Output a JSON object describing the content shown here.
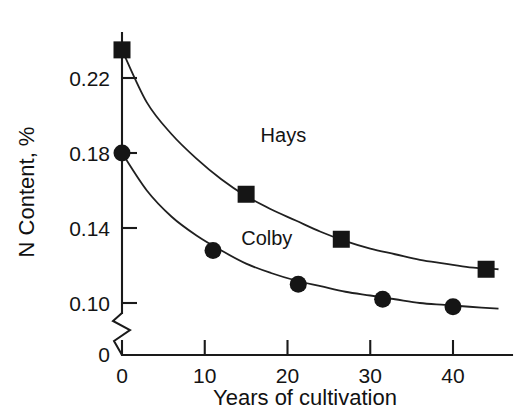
{
  "chart_data": {
    "type": "scatter",
    "title": "",
    "xlabel": "Years of cultivation",
    "ylabel": "N Content, %",
    "xlim": [
      0,
      46
    ],
    "ylim": [
      0.085,
      0.243
    ],
    "grid": false,
    "legend_position": "inline-annotation",
    "axis_break": {
      "axis": "y",
      "label_below_break": "0",
      "present": true
    },
    "xticks": [
      0,
      10,
      20,
      30,
      40
    ],
    "xticklabels": [
      "0",
      "10",
      "20",
      "30",
      "40"
    ],
    "yticks": [
      0.1,
      0.14,
      0.18,
      0.22
    ],
    "yticklabels": [
      "0.10",
      "0.14",
      "0.18",
      "0.22"
    ],
    "series": [
      {
        "name": "Hays",
        "marker": "square",
        "color": "#151515",
        "label_x": 19.5,
        "label_y": 0.186,
        "points": [
          {
            "x": 0.0,
            "y": 0.235
          },
          {
            "x": 15.0,
            "y": 0.158
          },
          {
            "x": 26.5,
            "y": 0.134
          },
          {
            "x": 44.0,
            "y": 0.118
          }
        ],
        "fit_curve": [
          {
            "x": 0.0,
            "y": 0.235
          },
          {
            "x": 3.0,
            "y": 0.207
          },
          {
            "x": 6.0,
            "y": 0.19
          },
          {
            "x": 9.0,
            "y": 0.177
          },
          {
            "x": 12.0,
            "y": 0.166
          },
          {
            "x": 15.0,
            "y": 0.157
          },
          {
            "x": 18.0,
            "y": 0.15
          },
          {
            "x": 21.0,
            "y": 0.144
          },
          {
            "x": 24.0,
            "y": 0.138
          },
          {
            "x": 27.0,
            "y": 0.133
          },
          {
            "x": 30.0,
            "y": 0.129
          },
          {
            "x": 33.0,
            "y": 0.126
          },
          {
            "x": 36.0,
            "y": 0.123
          },
          {
            "x": 39.0,
            "y": 0.121
          },
          {
            "x": 42.0,
            "y": 0.119
          },
          {
            "x": 45.5,
            "y": 0.118
          }
        ]
      },
      {
        "name": "Colby",
        "marker": "circle",
        "color": "#151515",
        "label_x": 17.5,
        "label_y": 0.131,
        "points": [
          {
            "x": 0.0,
            "y": 0.18
          },
          {
            "x": 11.0,
            "y": 0.128
          },
          {
            "x": 21.3,
            "y": 0.11
          },
          {
            "x": 31.5,
            "y": 0.102
          },
          {
            "x": 40.0,
            "y": 0.098
          }
        ],
        "fit_curve": [
          {
            "x": 0.0,
            "y": 0.18
          },
          {
            "x": 3.0,
            "y": 0.16
          },
          {
            "x": 6.0,
            "y": 0.146
          },
          {
            "x": 9.0,
            "y": 0.136
          },
          {
            "x": 12.0,
            "y": 0.128
          },
          {
            "x": 15.0,
            "y": 0.121
          },
          {
            "x": 18.0,
            "y": 0.116
          },
          {
            "x": 21.0,
            "y": 0.112
          },
          {
            "x": 24.0,
            "y": 0.109
          },
          {
            "x": 27.0,
            "y": 0.106
          },
          {
            "x": 30.0,
            "y": 0.104
          },
          {
            "x": 33.0,
            "y": 0.102
          },
          {
            "x": 36.0,
            "y": 0.1
          },
          {
            "x": 39.0,
            "y": 0.099
          },
          {
            "x": 42.0,
            "y": 0.098
          },
          {
            "x": 45.5,
            "y": 0.097
          }
        ]
      }
    ]
  }
}
